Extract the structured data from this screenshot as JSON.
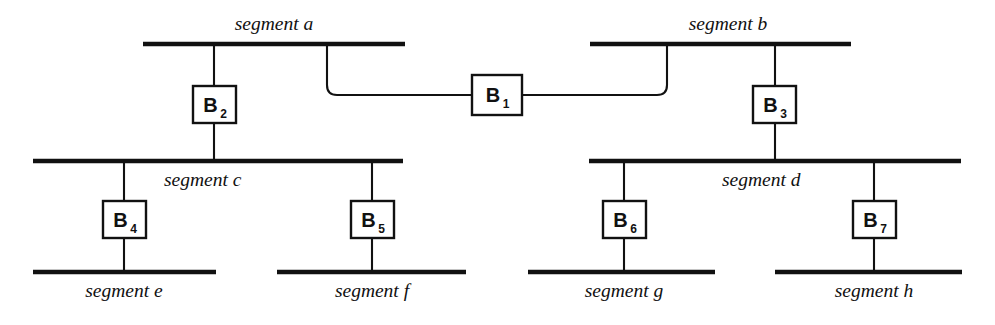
{
  "diagram": {
    "type": "network-topology",
    "colors": {
      "line": "#111111",
      "background": "#ffffff",
      "box_fill": "#ffffff"
    },
    "segments": [
      {
        "id": "a",
        "label": "segment a",
        "bar": {
          "x1": 143,
          "x2": 405,
          "y": 44,
          "thickness": 4.6
        },
        "label_pos": {
          "x": 274,
          "y": 30,
          "anchor": "middle"
        }
      },
      {
        "id": "b",
        "label": "segment b",
        "bar": {
          "x1": 590,
          "x2": 851,
          "y": 44,
          "thickness": 4.6
        },
        "label_pos": {
          "x": 728,
          "y": 30,
          "anchor": "middle"
        }
      },
      {
        "id": "c",
        "label": "segment c",
        "bar": {
          "x1": 33,
          "x2": 403,
          "y": 161,
          "thickness": 4.6
        },
        "label_pos": {
          "x": 164,
          "y": 186,
          "anchor": "start"
        }
      },
      {
        "id": "d",
        "label": "segment d",
        "bar": {
          "x1": 589,
          "x2": 961,
          "y": 161,
          "thickness": 4.6
        },
        "label_pos": {
          "x": 722,
          "y": 186,
          "anchor": "start"
        }
      },
      {
        "id": "e",
        "label": "segment e",
        "bar": {
          "x1": 33,
          "x2": 216,
          "y": 272,
          "thickness": 4.6
        },
        "label_pos": {
          "x": 124,
          "y": 297,
          "anchor": "middle"
        }
      },
      {
        "id": "f",
        "label": "segment f",
        "bar": {
          "x1": 277,
          "x2": 466,
          "y": 272,
          "thickness": 4.6
        },
        "label_pos": {
          "x": 372,
          "y": 297,
          "anchor": "middle"
        }
      },
      {
        "id": "g",
        "label": "segment g",
        "bar": {
          "x1": 528,
          "x2": 715,
          "y": 272,
          "thickness": 4.6
        },
        "label_pos": {
          "x": 624,
          "y": 297,
          "anchor": "middle"
        }
      },
      {
        "id": "h",
        "label": "segment h",
        "bar": {
          "x1": 775,
          "x2": 962,
          "y": 272,
          "thickness": 4.6
        },
        "label_pos": {
          "x": 874,
          "y": 297,
          "anchor": "middle"
        }
      }
    ],
    "bridges": [
      {
        "id": "B1",
        "letter": "B",
        "subscript": "1",
        "box": {
          "x": 472,
          "y": 75,
          "w": 50,
          "h": 40
        },
        "connects": [
          "a",
          "b"
        ]
      },
      {
        "id": "B2",
        "letter": "B",
        "subscript": "2",
        "box": {
          "x": 193,
          "y": 86,
          "w": 43,
          "h": 37
        },
        "connects": [
          "a",
          "c"
        ]
      },
      {
        "id": "B3",
        "letter": "B",
        "subscript": "3",
        "box": {
          "x": 753,
          "y": 86,
          "w": 43,
          "h": 37
        },
        "connects": [
          "b",
          "d"
        ]
      },
      {
        "id": "B4",
        "letter": "B",
        "subscript": "4",
        "box": {
          "x": 103,
          "y": 201,
          "w": 43,
          "h": 37
        },
        "connects": [
          "c",
          "e"
        ]
      },
      {
        "id": "B5",
        "letter": "B",
        "subscript": "5",
        "box": {
          "x": 351,
          "y": 201,
          "w": 43,
          "h": 37
        },
        "connects": [
          "c",
          "f"
        ]
      },
      {
        "id": "B6",
        "letter": "B",
        "subscript": "6",
        "box": {
          "x": 603,
          "y": 201,
          "w": 43,
          "h": 37
        },
        "connects": [
          "d",
          "g"
        ]
      },
      {
        "id": "B7",
        "letter": "B",
        "subscript": "7",
        "box": {
          "x": 853,
          "y": 201,
          "w": 43,
          "h": 37
        },
        "connects": [
          "d",
          "h"
        ]
      }
    ],
    "drop_lines": [
      {
        "name": "a-to-B2",
        "x": 214,
        "y1": 44,
        "y2": 86
      },
      {
        "name": "B2-to-c",
        "x": 214,
        "y1": 123,
        "y2": 161
      },
      {
        "name": "b-to-B3",
        "x": 775,
        "y1": 44,
        "y2": 86
      },
      {
        "name": "B3-to-d",
        "x": 775,
        "y1": 123,
        "y2": 161
      },
      {
        "name": "c-to-B4",
        "x": 124,
        "y1": 161,
        "y2": 201
      },
      {
        "name": "B4-to-e",
        "x": 124,
        "y1": 238,
        "y2": 272
      },
      {
        "name": "c-to-B5",
        "x": 372,
        "y1": 161,
        "y2": 201
      },
      {
        "name": "B5-to-f",
        "x": 372,
        "y1": 238,
        "y2": 272
      },
      {
        "name": "d-to-B6",
        "x": 624,
        "y1": 161,
        "y2": 201
      },
      {
        "name": "B6-to-g",
        "x": 624,
        "y1": 238,
        "y2": 272
      },
      {
        "name": "d-to-B7",
        "x": 874,
        "y1": 161,
        "y2": 201
      },
      {
        "name": "B7-to-h",
        "x": 874,
        "y1": 238,
        "y2": 272
      }
    ],
    "link_paths": [
      {
        "name": "segment-a-to-B1",
        "d": "M 327 44 L 327 85 Q 327 95 337 95 L 472 95"
      },
      {
        "name": "B1-to-segment-b",
        "d": "M 522 95 L 657 95 Q 667 95 667 85 L 667 44"
      }
    ]
  }
}
